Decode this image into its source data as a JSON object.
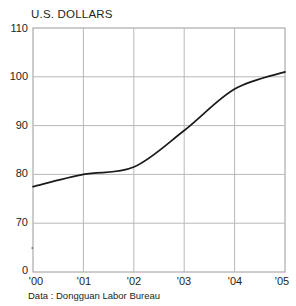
{
  "chart_data": {
    "type": "line",
    "title": "U.S. DOLLARS",
    "subtitle": "",
    "xlabel": "",
    "ylabel": "",
    "x": [
      "'00",
      "'01",
      "'02",
      "'03",
      "'04",
      "'05"
    ],
    "categories": [
      "'00",
      "'01",
      "'02",
      "'03",
      "'04",
      "'05"
    ],
    "values": [
      77.5,
      80.0,
      81.5,
      89.0,
      97.5,
      101.0
    ],
    "series": [
      {
        "name": "U.S. DOLLARS",
        "values": [
          77.5,
          80.0,
          81.5,
          89.0,
          97.5,
          101.0
        ]
      }
    ],
    "ylim": [
      70,
      110
    ],
    "y_ticks": [
      "70",
      "80",
      "90",
      "100",
      "110"
    ],
    "y_axis_broken": true,
    "y_origin_label": "0",
    "x_ticks": [
      "'00",
      "'01",
      "'02",
      "'03",
      "'04",
      "'05"
    ],
    "grid": true,
    "legend": "none",
    "line_color": "#1a1a1a",
    "grid_color": "#b4b4b4",
    "axis_color": "#8c8c8c"
  },
  "title": "U.S. DOLLARS",
  "source": "Data : Dongguan Labor Bureau",
  "y_axis": {
    "ticks": [
      {
        "label": "110"
      },
      {
        "label": "100"
      },
      {
        "label": "90"
      },
      {
        "label": "80"
      },
      {
        "label": "70"
      }
    ],
    "origin_label": "0",
    "break_icon": "axis-break-icon"
  },
  "x_axis": {
    "ticks": [
      {
        "label": "'00"
      },
      {
        "label": "'01"
      },
      {
        "label": "'02"
      },
      {
        "label": "'03"
      },
      {
        "label": "'04"
      },
      {
        "label": "'05"
      }
    ]
  }
}
